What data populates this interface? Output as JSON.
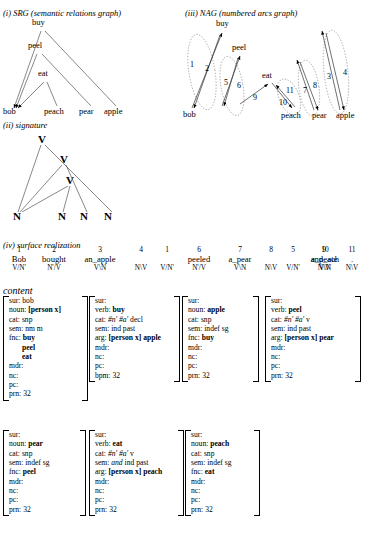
{
  "sections": {
    "srg_title": "(i) SRG (semantic relations graph)",
    "signature_title": "(ii) signature",
    "nag_title": "(iii) NAG (numbered arcs graph)",
    "surface_title": "(iv) surface realization",
    "content_title": "content"
  },
  "srg": {
    "nodes": [
      {
        "label": "buy",
        "x": 32,
        "y": 25
      },
      {
        "label": "peel",
        "x": 28,
        "y": 48
      },
      {
        "label": "eat",
        "x": 38,
        "y": 76
      },
      {
        "label": "bob",
        "x": 3,
        "y": 112
      },
      {
        "label": "peach",
        "x": 44,
        "y": 112
      },
      {
        "label": "pear",
        "x": 79,
        "y": 112
      },
      {
        "label": "apple",
        "x": 104,
        "y": 112
      }
    ]
  },
  "signature": {
    "nodes": [
      {
        "label": "V",
        "x": 38,
        "y": 137
      },
      {
        "label": "V",
        "x": 60,
        "y": 157
      },
      {
        "label": "V",
        "x": 66,
        "y": 178
      },
      {
        "label": "N",
        "x": 13,
        "y": 215
      },
      {
        "label": "N",
        "x": 58,
        "y": 215
      },
      {
        "label": "N",
        "x": 80,
        "y": 215
      },
      {
        "label": "N",
        "x": 104,
        "y": 215
      }
    ]
  },
  "nag": {
    "nodes": [
      {
        "label": "buy",
        "x": 216,
        "y": 25
      },
      {
        "label": "peel",
        "x": 232,
        "y": 48
      },
      {
        "label": "eat",
        "x": 262,
        "y": 76
      },
      {
        "label": "bob",
        "x": 186,
        "y": 112
      },
      {
        "label": "peach",
        "x": 284,
        "y": 115
      },
      {
        "label": "pear",
        "x": 313,
        "y": 115
      },
      {
        "label": "apple",
        "x": 337,
        "y": 115
      }
    ],
    "arcs": [
      {
        "n": "1",
        "x": 190,
        "y": 64
      },
      {
        "n": "2",
        "x": 205,
        "y": 68
      },
      {
        "n": "5",
        "x": 226,
        "y": 82
      },
      {
        "n": "6",
        "x": 238,
        "y": 85
      },
      {
        "n": "9",
        "x": 255,
        "y": 96
      },
      {
        "n": "10",
        "x": 283,
        "y": 101
      },
      {
        "n": "11",
        "x": 288,
        "y": 89
      },
      {
        "n": "7",
        "x": 304,
        "y": 89
      },
      {
        "n": "8",
        "x": 314,
        "y": 84
      },
      {
        "n": "3",
        "x": 328,
        "y": 75
      },
      {
        "n": "4",
        "x": 344,
        "y": 71
      }
    ]
  },
  "chart_data": {
    "type": "diagram",
    "srg_edges": [
      [
        "buy",
        "bob"
      ],
      [
        "buy",
        "apple"
      ],
      [
        "peel",
        "bob"
      ],
      [
        "peel",
        "pear"
      ],
      [
        "eat",
        "bob"
      ],
      [
        "eat",
        "peach"
      ]
    ],
    "signature_edges": [
      [
        "V1",
        "N1"
      ],
      [
        "V1",
        "N4"
      ],
      [
        "V2",
        "N1"
      ],
      [
        "V2",
        "N3"
      ],
      [
        "V3",
        "N1"
      ],
      [
        "V3",
        "N2"
      ]
    ],
    "nag_arcs": [
      {
        "number": 1,
        "from": "bob",
        "to": "buy"
      },
      {
        "number": 2,
        "from": "buy",
        "to": "bob"
      },
      {
        "number": 3,
        "from": "apple",
        "to": "buy"
      },
      {
        "number": 4,
        "from": "buy",
        "to": "apple"
      },
      {
        "number": 5,
        "from": "bob",
        "to": "peel"
      },
      {
        "number": 6,
        "from": "peel",
        "to": "bob"
      },
      {
        "number": 7,
        "from": "pear",
        "to": "peel"
      },
      {
        "number": 8,
        "from": "peel",
        "to": "pear"
      },
      {
        "number": 9,
        "from": "bob",
        "to": "eat"
      },
      {
        "number": 10,
        "from": "eat",
        "to": "peach"
      },
      {
        "number": 11,
        "from": "peach",
        "to": "eat"
      }
    ]
  },
  "surface": {
    "columns": [
      {
        "num": "1",
        "word": "Bob",
        "cat": "V/N'",
        "x": 4,
        "w": 30
      },
      {
        "num": "2",
        "word": "bought",
        "cat": "N'/V",
        "x": 33,
        "w": 42
      },
      {
        "num": "3",
        "word": "an_apple",
        "cat": "V\\N",
        "x": 74,
        "w": 52
      },
      {
        "num": "4",
        "word": "",
        "cat": "N\\V",
        "x": 127,
        "w": 28
      },
      {
        "num": "1",
        "word": "",
        "cat": "V/N'",
        "x": 154,
        "w": 26
      },
      {
        "num": "6",
        "word": "peeled",
        "cat": "N'/V",
        "x": 178,
        "w": 42
      },
      {
        "num": "7",
        "word": "a_pear",
        "cat": "V\\N",
        "x": 219,
        "w": 42
      },
      {
        "num": "8",
        "word": "",
        "cat": "N\\V",
        "x": 259,
        "w": 24
      },
      {
        "num": "5",
        "word": "",
        "cat": "V/N'",
        "x": 281,
        "w": 24
      },
      {
        "num": "9",
        "word": "and_ate",
        "cat": "N\\V",
        "x": 302,
        "w": 44
      },
      {
        "num": "10",
        "word": "a_peach",
        "cat": "V\\N",
        "x": 303,
        "w": 44
      },
      {
        "num": "11",
        "word": ".",
        "cat": "N\\V",
        "x": 340,
        "w": 24
      }
    ]
  },
  "proplets": [
    {
      "x": 3,
      "y": 296,
      "w": 84,
      "h": 112,
      "rows": [
        {
          "k": "sur:",
          "v": "bob"
        },
        {
          "k": "noun:",
          "v": "[person x]",
          "bold": true
        },
        {
          "k": "cat:",
          "v": "snp"
        },
        {
          "k": "sem:",
          "v": "nm m"
        },
        {
          "k": "fnc:",
          "v": "buy",
          "bold": true
        },
        {
          "cont": "peel"
        },
        {
          "cont": "eat"
        },
        {
          "k": "mdr:",
          "v": ""
        },
        {
          "k": "nc:",
          "v": ""
        },
        {
          "k": "pc:",
          "v": ""
        },
        {
          "k": "prn:",
          "v": "32"
        }
      ]
    },
    {
      "x": 89,
      "y": 296,
      "w": 90,
      "h": 103,
      "rows": [
        {
          "k": "sur:",
          "v": ""
        },
        {
          "k": "verb:",
          "v": "buy",
          "bold": true
        },
        {
          "k": "cat:",
          "v": "#n' #a' decl",
          "italic_first": true
        },
        {
          "k": "sem:",
          "v": "ind past"
        },
        {
          "k": "arg:",
          "v": "[person x] apple",
          "bold": true
        },
        {
          "k": "mdr:",
          "v": ""
        },
        {
          "k": "nc:",
          "v": ""
        },
        {
          "k": "pc:",
          "v": ""
        },
        {
          "k": "bpm:",
          "v": "32"
        }
      ]
    },
    {
      "x": 182,
      "y": 296,
      "w": 76,
      "h": 103,
      "rows": [
        {
          "k": "sur:",
          "v": ""
        },
        {
          "k": "noun:",
          "v": "apple",
          "bold": true
        },
        {
          "k": "cat:",
          "v": "snp"
        },
        {
          "k": "sem:",
          "v": "indef sg"
        },
        {
          "k": "fnc:",
          "v": "buy",
          "bold": true
        },
        {
          "k": "mdr:",
          "v": ""
        },
        {
          "k": "nc:",
          "v": ""
        },
        {
          "k": "pc:",
          "v": ""
        },
        {
          "k": "prn:",
          "v": "32"
        }
      ]
    },
    {
      "x": 265,
      "y": 296,
      "w": 95,
      "h": 103,
      "rows": [
        {
          "k": "sur:",
          "v": ""
        },
        {
          "k": "verb:",
          "v": "peel",
          "bold": true
        },
        {
          "k": "cat:",
          "v": "#n' #a' v",
          "italic_first": true
        },
        {
          "k": "sem:",
          "v": "ind past"
        },
        {
          "k": "arg:",
          "v": "[person x] pear",
          "bold": true
        },
        {
          "k": "mdr:",
          "v": ""
        },
        {
          "k": "nc:",
          "v": ""
        },
        {
          "k": "pc:",
          "v": ""
        },
        {
          "k": "prn:",
          "v": "32"
        }
      ]
    },
    {
      "x": 3,
      "y": 430,
      "w": 82,
      "h": 103,
      "rows": [
        {
          "k": "sur:",
          "v": ""
        },
        {
          "k": "noun:",
          "v": "pear",
          "bold": true
        },
        {
          "k": "cat:",
          "v": "snp"
        },
        {
          "k": "sem:",
          "v": "indef sg"
        },
        {
          "k": "fnc:",
          "v": "peel",
          "bold": true
        },
        {
          "k": "mdr:",
          "v": ""
        },
        {
          "k": "nc:",
          "v": ""
        },
        {
          "k": "pc:",
          "v": ""
        },
        {
          "k": "prn:",
          "v": "32"
        }
      ]
    },
    {
      "x": 89,
      "y": 430,
      "w": 94,
      "h": 103,
      "rows": [
        {
          "k": "sur:",
          "v": ""
        },
        {
          "k": "verb:",
          "v": "eat",
          "bold": true
        },
        {
          "k": "cat:",
          "v": "#n' #a' v",
          "italic_first": true
        },
        {
          "k": "sem:",
          "v": "and ind past",
          "italic_and": true
        },
        {
          "k": "arg:",
          "v": "[person x] peach",
          "bold": true
        },
        {
          "k": "mdr:",
          "v": ""
        },
        {
          "k": "nc:",
          "v": ""
        },
        {
          "k": "pc:",
          "v": ""
        },
        {
          "k": "prn:",
          "v": "32"
        }
      ]
    },
    {
      "x": 185,
      "y": 430,
      "w": 74,
      "h": 103,
      "rows": [
        {
          "k": "sur:",
          "v": ""
        },
        {
          "k": "noun:",
          "v": "peach",
          "bold": true
        },
        {
          "k": "cat:",
          "v": "snp"
        },
        {
          "k": "sem:",
          "v": "indef sg"
        },
        {
          "k": "fnc:",
          "v": "eat",
          "bold": true
        },
        {
          "k": "mdr:",
          "v": ""
        },
        {
          "k": "nc:",
          "v": ""
        },
        {
          "k": "pc:",
          "v": ""
        },
        {
          "k": "prn:",
          "v": "32"
        }
      ]
    }
  ]
}
